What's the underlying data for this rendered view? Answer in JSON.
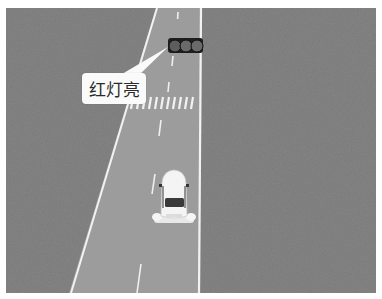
{
  "scene": {
    "description": "Top-down view of a road with a traffic light, crosswalk, and a white car",
    "colors": {
      "grass": "#7d7d7d",
      "road": "#9a9a9a",
      "lane_line": "#f2f2f2",
      "car": "#f5f5f5",
      "traffic_light_body": "#1e1e1e",
      "traffic_light_lamp": "#6a6a6a",
      "callout_bg": "#fafafa"
    }
  },
  "traffic_light": {
    "lamp_count": 3,
    "state": "red"
  },
  "callout": {
    "text": "红灯亮"
  }
}
